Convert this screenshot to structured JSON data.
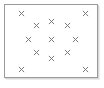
{
  "figure": {
    "kind": "scatter-plot-thumbnail",
    "background_color": "#ffffff",
    "frame": {
      "border_color": "#9a9a9a",
      "border_width_px": 1,
      "fill_color": "#ffffff",
      "shadow_color": "#d8d8d8"
    },
    "marker": {
      "glyph": "times-icon",
      "character": "×",
      "color": "#7b7b7b",
      "size_px": 7,
      "count": 13
    },
    "title": "",
    "axis_labels": {
      "x": "",
      "y": ""
    },
    "tick_labels": {
      "x": [],
      "y": []
    },
    "legend": {
      "visible": false,
      "entries": []
    }
  },
  "chart_data": {
    "type": "scatter",
    "title": "",
    "xlabel": "",
    "ylabel": "",
    "xlim": [
      0,
      100
    ],
    "ylim": [
      0,
      100
    ],
    "grid": false,
    "legend": {
      "visible": false,
      "position": "none"
    },
    "series": [
      {
        "name": "points",
        "marker": "x",
        "color": "#7b7b7b",
        "points": [
          {
            "x": 18,
            "y": 88
          },
          {
            "x": 88,
            "y": 88
          },
          {
            "x": 51,
            "y": 77
          },
          {
            "x": 34,
            "y": 71
          },
          {
            "x": 68,
            "y": 71
          },
          {
            "x": 26,
            "y": 52
          },
          {
            "x": 51,
            "y": 52
          },
          {
            "x": 77,
            "y": 52
          },
          {
            "x": 34,
            "y": 34
          },
          {
            "x": 68,
            "y": 34
          },
          {
            "x": 51,
            "y": 26
          },
          {
            "x": 18,
            "y": 11
          },
          {
            "x": 88,
            "y": 11
          }
        ]
      }
    ]
  }
}
